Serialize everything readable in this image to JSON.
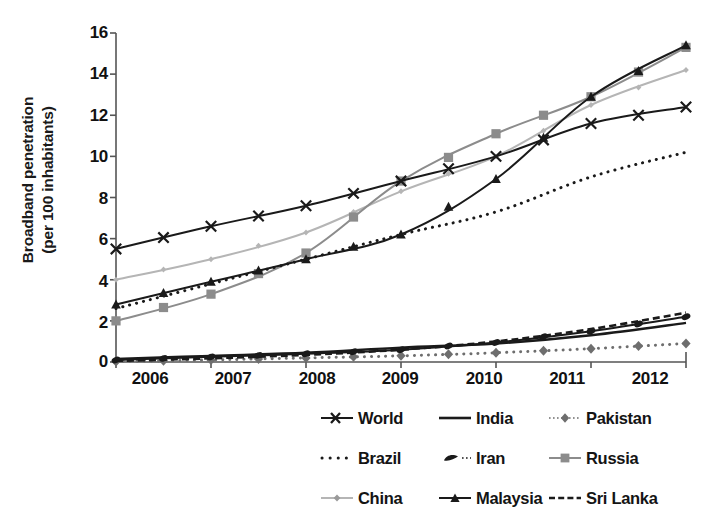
{
  "chart_data": {
    "type": "line",
    "title": "",
    "xlabel": "",
    "ylabel": "Broadband penetration (per 100 inhabitants)",
    "ylabel_line1": "Broadband penetration",
    "ylabel_line2": "(per 100 inhabitants)",
    "x": [
      2006,
      2007,
      2008,
      2009,
      2010,
      2011,
      2012
    ],
    "xtick_labels": [
      "2006",
      "2007",
      "2008",
      "2009",
      "2010",
      "2011",
      "2012"
    ],
    "ytick_labels": [
      "0",
      "2",
      "4",
      "6",
      "8",
      "10",
      "12",
      "14",
      "16"
    ],
    "ytick_values": [
      0,
      2,
      4,
      6,
      8,
      10,
      12,
      14,
      16
    ],
    "xlim": [
      2006,
      2012
    ],
    "ylim": [
      0,
      16
    ],
    "grid": false,
    "legend_position": "bottom",
    "legend_columns": 3,
    "series": [
      {
        "name": "World",
        "marker": "x",
        "line_style": "solid",
        "color": "#1a1a1a",
        "values": [
          5.5,
          6.6,
          7.6,
          8.8,
          10.0,
          11.6,
          12.4
        ]
      },
      {
        "name": "India",
        "marker": "none",
        "line_style": "solid",
        "color": "#1a1a1a",
        "values": [
          0.15,
          0.3,
          0.45,
          0.7,
          0.9,
          1.3,
          1.9
        ]
      },
      {
        "name": "Pakistan",
        "marker": "diamond",
        "line_style": "dotted",
        "color": "#6e6e6e",
        "values": [
          0.02,
          0.1,
          0.2,
          0.3,
          0.45,
          0.65,
          0.9
        ]
      },
      {
        "name": "Brazil",
        "marker": "none",
        "line_style": "dotted",
        "color": "#1a1a1a",
        "values": [
          2.6,
          3.8,
          5.0,
          6.2,
          7.3,
          9.0,
          10.2
        ]
      },
      {
        "name": "Iran",
        "marker": "filled",
        "line_style": "solid",
        "color": "#1a1a1a",
        "values": [
          0.1,
          0.25,
          0.4,
          0.6,
          0.95,
          1.5,
          2.2
        ]
      },
      {
        "name": "Russia",
        "marker": "square",
        "line_style": "solid",
        "color": "#8c8c8c",
        "values": [
          2.0,
          3.3,
          5.3,
          8.8,
          11.1,
          12.9,
          15.3
        ]
      },
      {
        "name": "China",
        "marker": "small-diamond",
        "line_style": "solid",
        "color": "#b5b5b5",
        "values": [
          4.0,
          5.0,
          6.3,
          8.3,
          10.0,
          12.5,
          14.2
        ]
      },
      {
        "name": "Malaysia",
        "marker": "triangle",
        "line_style": "solid",
        "color": "#1a1a1a",
        "values": [
          2.8,
          3.9,
          5.0,
          6.2,
          8.9,
          12.9,
          15.4
        ]
      },
      {
        "name": "Sri Lanka",
        "marker": "none",
        "line_style": "dashed",
        "color": "#1a1a1a",
        "values": [
          0.05,
          0.18,
          0.35,
          0.6,
          1.0,
          1.6,
          2.4
        ]
      }
    ]
  },
  "legend": {
    "items": [
      {
        "label": "World",
        "key": "marker-x-line"
      },
      {
        "label": "India",
        "key": "solid-line"
      },
      {
        "label": "Pakistan",
        "key": "diamond-dotted-line"
      },
      {
        "label": "Brazil",
        "key": "dotted-line"
      },
      {
        "label": "Iran",
        "key": "filled-marker-line"
      },
      {
        "label": "Russia",
        "key": "square-line"
      },
      {
        "label": "China",
        "key": "small-diamond-line"
      },
      {
        "label": "Malaysia",
        "key": "triangle-line"
      },
      {
        "label": "Sri Lanka",
        "key": "dashed-line"
      }
    ]
  }
}
